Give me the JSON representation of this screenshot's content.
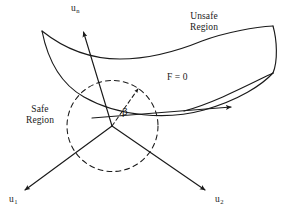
{
  "figure": {
    "background_color": "#ffffff",
    "stroke_color": "#1a1a1a",
    "width": 284,
    "height": 217
  },
  "labels": {
    "unsafe_region_line1": "Unsafe",
    "unsafe_region_line2": "Region",
    "safe_region_line1": "Safe",
    "safe_region_line2": "Region",
    "limit_state": "F = 0",
    "angle": "β",
    "axis_n": "u",
    "axis_n_sub": "n",
    "axis_1": "u",
    "axis_1_sub": "1",
    "axis_2": "u",
    "axis_2_sub": "2"
  },
  "geometry": {
    "origin": {
      "x": 112,
      "y": 126
    },
    "circle": {
      "cx": 112.5,
      "cy": 126,
      "r": 45.5,
      "dash": "5,4"
    },
    "axes": [
      {
        "name": "u-n",
        "x1": 112,
        "y1": 126,
        "x2": 83,
        "y2": 31
      },
      {
        "name": "u-1",
        "x1": 112,
        "y1": 126,
        "x2": 24,
        "y2": 191
      },
      {
        "name": "u-2",
        "x1": 112,
        "y1": 126,
        "x2": 206,
        "y2": 191
      },
      {
        "name": "beta-direction",
        "x1": 112,
        "y1": 126,
        "x2": 139,
        "y2": 88
      }
    ],
    "surface": {
      "top_edge": "M42,31 C60,46 85,58 118,58 C150,58 180,48 200,40 C225,31 255,27 273,26",
      "bottom_edge": "M42,31 C48,55 60,82 85,97 C120,118 170,120 205,109 C240,98 262,84 273,73",
      "right_tip": "M273,26 C276,40 277,62 273,73",
      "lower_fold": "M273,73 C250,84 215,102 185,110"
    },
    "tangent_arrow": {
      "x1": 92,
      "y1": 118,
      "x2": 232,
      "y2": 106
    }
  },
  "colors": {
    "stroke": "#1a1a1a",
    "text": "#1a1a1a",
    "background": "#ffffff"
  }
}
